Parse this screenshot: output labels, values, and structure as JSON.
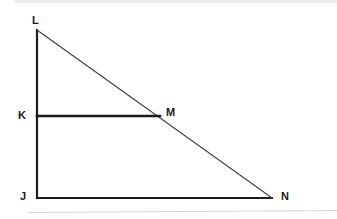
{
  "figure": {
    "type": "geometry-diagram",
    "background_color": "#ffffff",
    "stroke_color": "#1a1a1a",
    "hypotenuse_color": "#444444",
    "artifact_color": "#d8d8d8",
    "canvas": {
      "width": 337,
      "height": 219
    },
    "points": [
      {
        "id": "L",
        "label": "L",
        "x": 37,
        "y": 30
      },
      {
        "id": "K",
        "label": "K",
        "x": 37,
        "y": 116
      },
      {
        "id": "M",
        "label": "M",
        "x": 160,
        "y": 116
      },
      {
        "id": "J",
        "label": "J",
        "x": 37,
        "y": 198
      },
      {
        "id": "N",
        "label": "N",
        "x": 272,
        "y": 198
      }
    ],
    "segments": [
      {
        "id": "JL",
        "from": "J",
        "to": "L",
        "width": 2.2,
        "color": "#1a1a1a"
      },
      {
        "id": "JN",
        "from": "J",
        "to": "N",
        "width": 2.0,
        "color": "#1a1a1a"
      },
      {
        "id": "LN",
        "from": "L",
        "to": "N",
        "width": 1.1,
        "color": "#444444"
      },
      {
        "id": "KM",
        "from": "K",
        "to": "M",
        "width": 2.6,
        "color": "#1a1a1a"
      }
    ],
    "labels": {
      "L": "L",
      "K": "K",
      "M": "M",
      "J": "J",
      "N": "N"
    }
  }
}
